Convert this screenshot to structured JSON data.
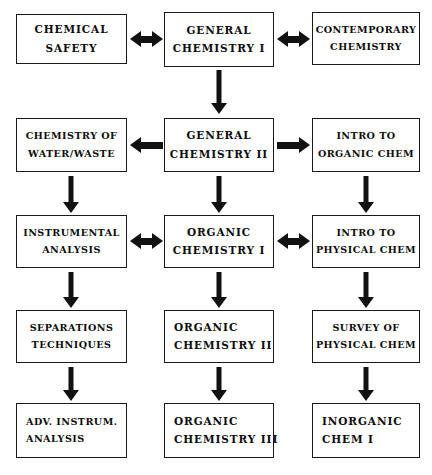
{
  "diagram": {
    "ink_color": "#111111",
    "background_color": "#ffffff",
    "columns": 3,
    "rows": 5,
    "nodes": [
      {
        "id": "chemical-safety",
        "col": 1,
        "row": 1,
        "line1": "CHEMICAL",
        "line2": "SAFETY"
      },
      {
        "id": "general-chemistry-i",
        "col": 2,
        "row": 1,
        "line1": "GENERAL",
        "line2": "CHEMISTRY I"
      },
      {
        "id": "contemporary-chemistry",
        "col": 3,
        "row": 1,
        "line1": "CONTEMPORARY",
        "line2": "CHEMISTRY"
      },
      {
        "id": "chemistry-of-water-waste",
        "col": 1,
        "row": 2,
        "line1": "CHEMISTRY OF",
        "line2": "WATER/WASTE"
      },
      {
        "id": "general-chemistry-ii",
        "col": 2,
        "row": 2,
        "line1": "GENERAL",
        "line2": "CHEMISTRY II"
      },
      {
        "id": "intro-to-organic-chem",
        "col": 3,
        "row": 2,
        "line1": "INTRO TO",
        "line2": "ORGANIC CHEM"
      },
      {
        "id": "instrumental-analysis",
        "col": 1,
        "row": 3,
        "line1": "INSTRUMENTAL",
        "line2": "ANALYSIS"
      },
      {
        "id": "organic-chemistry-i",
        "col": 2,
        "row": 3,
        "line1": "ORGANIC",
        "line2": "CHEMISTRY I"
      },
      {
        "id": "intro-to-physical-chem",
        "col": 3,
        "row": 3,
        "line1": "INTRO TO",
        "line2": "PHYSICAL CHEM"
      },
      {
        "id": "separations-techniques",
        "col": 1,
        "row": 4,
        "line1": "SEPARATIONS",
        "line2": "TECHNIQUES"
      },
      {
        "id": "organic-chemistry-ii",
        "col": 2,
        "row": 4,
        "line1": "ORGANIC",
        "line2": "CHEMISTRY II"
      },
      {
        "id": "survey-of-physical-chem",
        "col": 3,
        "row": 4,
        "line1": "SURVEY OF",
        "line2": "PHYSICAL CHEM"
      },
      {
        "id": "adv-instrum-analysis",
        "col": 1,
        "row": 5,
        "line1": "ADV. INSTRUM.",
        "line2": "ANALYSIS"
      },
      {
        "id": "organic-chemistry-iii",
        "col": 2,
        "row": 5,
        "line1": "ORGANIC",
        "line2": "CHEMISTRY III"
      },
      {
        "id": "inorganic-chem-i",
        "col": 3,
        "row": 5,
        "line1": "INORGANIC",
        "line2": "CHEM I"
      }
    ],
    "connectors": [
      {
        "id": "c1",
        "kind": "horizontal",
        "direction": "bidirectional",
        "from": "chemical-safety",
        "to": "general-chemistry-i"
      },
      {
        "id": "c2",
        "kind": "horizontal",
        "direction": "bidirectional",
        "from": "general-chemistry-i",
        "to": "contemporary-chemistry"
      },
      {
        "id": "c3",
        "kind": "vertical",
        "direction": "down",
        "from": "general-chemistry-i",
        "to": "general-chemistry-ii"
      },
      {
        "id": "c4",
        "kind": "horizontal",
        "direction": "left",
        "from": "general-chemistry-ii",
        "to": "chemistry-of-water-waste"
      },
      {
        "id": "c5",
        "kind": "horizontal",
        "direction": "right",
        "from": "general-chemistry-ii",
        "to": "intro-to-organic-chem"
      },
      {
        "id": "c6",
        "kind": "vertical",
        "direction": "down",
        "from": "chemistry-of-water-waste",
        "to": "instrumental-analysis"
      },
      {
        "id": "c7",
        "kind": "vertical",
        "direction": "down",
        "from": "general-chemistry-ii",
        "to": "organic-chemistry-i"
      },
      {
        "id": "c8",
        "kind": "vertical",
        "direction": "down",
        "from": "intro-to-organic-chem",
        "to": "intro-to-physical-chem"
      },
      {
        "id": "c9",
        "kind": "horizontal",
        "direction": "bidirectional",
        "from": "instrumental-analysis",
        "to": "organic-chemistry-i"
      },
      {
        "id": "c10",
        "kind": "horizontal",
        "direction": "bidirectional",
        "from": "organic-chemistry-i",
        "to": "intro-to-physical-chem"
      },
      {
        "id": "c11",
        "kind": "vertical",
        "direction": "down",
        "from": "instrumental-analysis",
        "to": "separations-techniques"
      },
      {
        "id": "c12",
        "kind": "vertical",
        "direction": "down",
        "from": "organic-chemistry-i",
        "to": "organic-chemistry-ii"
      },
      {
        "id": "c13",
        "kind": "vertical",
        "direction": "down",
        "from": "intro-to-physical-chem",
        "to": "survey-of-physical-chem"
      },
      {
        "id": "c14",
        "kind": "vertical",
        "direction": "down",
        "from": "separations-techniques",
        "to": "adv-instrum-analysis"
      },
      {
        "id": "c15",
        "kind": "vertical",
        "direction": "down",
        "from": "organic-chemistry-ii",
        "to": "organic-chemistry-iii"
      },
      {
        "id": "c16",
        "kind": "vertical",
        "direction": "down",
        "from": "survey-of-physical-chem",
        "to": "inorganic-chem-i"
      }
    ]
  }
}
